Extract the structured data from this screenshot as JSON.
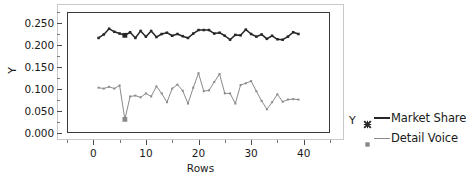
{
  "chart_data": {
    "type": "line",
    "title": "",
    "xlabel": "Rows",
    "ylabel": "Y",
    "legend_title": "Y",
    "legend_position": "right",
    "grid": false,
    "xlim": [
      -5,
      45
    ],
    "ylim": [
      0.0,
      0.275
    ],
    "xticks": [
      0,
      10,
      20,
      30,
      40
    ],
    "ytick_labels": [
      "0.000",
      "0.050",
      "0.100",
      "0.150",
      "0.200",
      "0.250"
    ],
    "yticks": [
      0.0,
      0.05,
      0.1,
      0.15,
      0.2,
      0.25
    ],
    "x": [
      1,
      2,
      3,
      4,
      5,
      6,
      7,
      8,
      9,
      10,
      11,
      12,
      13,
      14,
      15,
      16,
      17,
      18,
      19,
      20,
      21,
      22,
      23,
      24,
      25,
      26,
      27,
      28,
      29,
      30,
      31,
      32,
      33,
      34,
      35,
      36,
      37,
      38,
      39
    ],
    "series": [
      {
        "name": "Market Share",
        "color": "#262626",
        "marker": "x-marker",
        "highlight_point": {
          "x": 6,
          "y": 0.222
        },
        "values": [
          0.216,
          0.224,
          0.237,
          0.23,
          0.226,
          0.222,
          0.229,
          0.216,
          0.232,
          0.219,
          0.232,
          0.218,
          0.225,
          0.228,
          0.221,
          0.225,
          0.22,
          0.216,
          0.226,
          0.234,
          0.234,
          0.234,
          0.226,
          0.228,
          0.221,
          0.212,
          0.223,
          0.222,
          0.235,
          0.225,
          0.219,
          0.224,
          0.214,
          0.221,
          0.213,
          0.212,
          0.219,
          0.229,
          0.225
        ]
      },
      {
        "name": "Detail Voice",
        "color": "#8a8a8a",
        "marker": "square-marker",
        "highlight_point": {
          "x": 6,
          "y": 0.031
        },
        "values": [
          0.103,
          0.101,
          0.105,
          0.101,
          0.108,
          0.031,
          0.083,
          0.085,
          0.081,
          0.09,
          0.083,
          0.106,
          0.09,
          0.07,
          0.101,
          0.11,
          0.096,
          0.067,
          0.103,
          0.136,
          0.095,
          0.097,
          0.116,
          0.134,
          0.09,
          0.09,
          0.067,
          0.109,
          0.113,
          0.118,
          0.095,
          0.073,
          0.054,
          0.07,
          0.088,
          0.071,
          0.076,
          0.077,
          0.076
        ]
      }
    ]
  },
  "axes": {
    "x_title": "Rows",
    "y_title": "Y"
  },
  "legend": {
    "title": "Y",
    "entries": [
      {
        "label": "Market Share",
        "color": "#262626",
        "marker": "x-marker"
      },
      {
        "label": "Detail Voice",
        "color": "#8a8a8a",
        "marker": "square-marker"
      }
    ]
  }
}
